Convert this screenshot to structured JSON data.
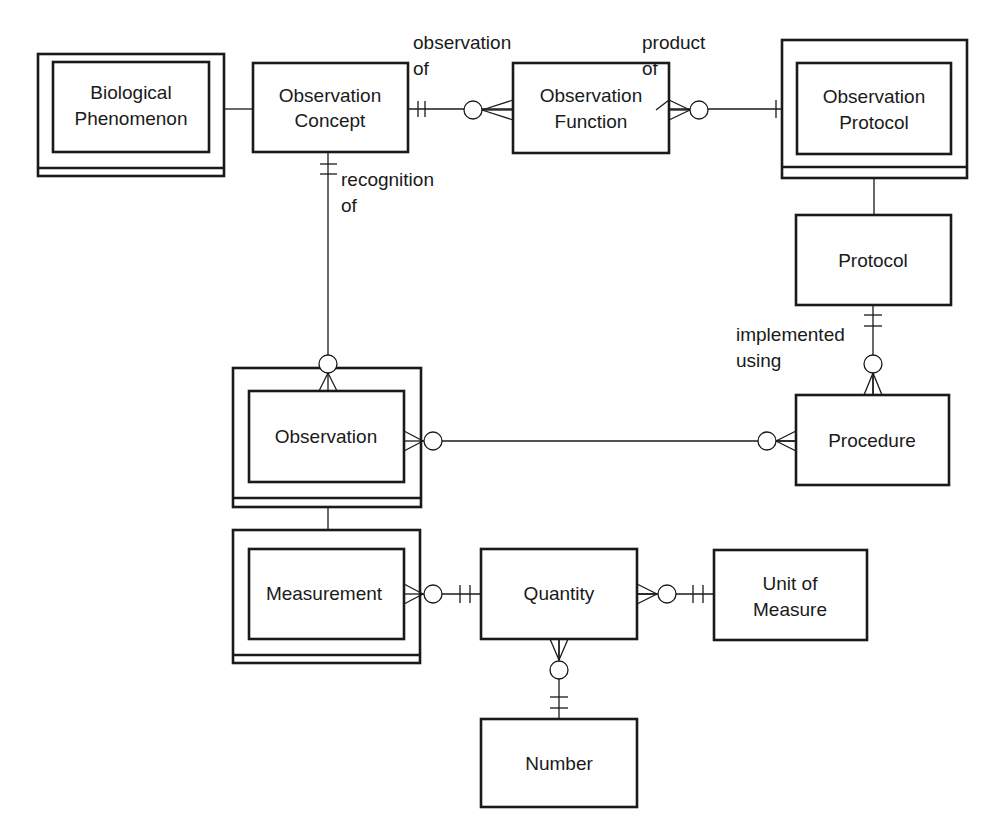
{
  "diagram": {
    "type": "entity-relationship",
    "notation": "crow's foot",
    "entities": [
      {
        "id": "biological_phenomenon",
        "lines": [
          "Biological",
          "Phenomenon"
        ],
        "weak": true
      },
      {
        "id": "observation_concept",
        "lines": [
          "Observation",
          "Concept"
        ],
        "weak": false
      },
      {
        "id": "observation_function",
        "lines": [
          "Observation",
          "Function"
        ],
        "weak": false
      },
      {
        "id": "observation_protocol",
        "lines": [
          "Observation",
          "Protocol"
        ],
        "weak": true
      },
      {
        "id": "protocol",
        "lines": [
          "Protocol"
        ],
        "weak": false
      },
      {
        "id": "observation",
        "lines": [
          "Observation"
        ],
        "weak": true
      },
      {
        "id": "procedure",
        "lines": [
          "Procedure"
        ],
        "weak": false
      },
      {
        "id": "measurement",
        "lines": [
          "Measurement"
        ],
        "weak": true
      },
      {
        "id": "quantity",
        "lines": [
          "Quantity"
        ],
        "weak": false
      },
      {
        "id": "unit_of_measure",
        "lines": [
          "Unit of",
          "Measure"
        ],
        "weak": false
      },
      {
        "id": "number",
        "lines": [
          "Number"
        ],
        "weak": false
      }
    ],
    "relationships": [
      {
        "from": "biological_phenomenon",
        "to": "observation_concept",
        "label": [],
        "from_end": "plain",
        "to_end": "plain"
      },
      {
        "from": "observation_concept",
        "to": "observation_function",
        "label": [
          "observation",
          "of"
        ],
        "from_end": "exactly-one",
        "to_end": "zero-or-many"
      },
      {
        "from": "observation_function",
        "to": "observation_protocol",
        "label": [
          "product",
          "of"
        ],
        "from_end": "zero-or-many",
        "to_end": "exactly-one"
      },
      {
        "from": "observation_protocol",
        "to": "protocol",
        "label": [],
        "from_end": "plain",
        "to_end": "plain"
      },
      {
        "from": "observation_concept",
        "to": "observation",
        "label": [
          "recognition",
          "of"
        ],
        "from_end": "exactly-one",
        "to_end": "zero-or-many"
      },
      {
        "from": "protocol",
        "to": "procedure",
        "label": [
          "implemented",
          "using"
        ],
        "from_end": "exactly-one",
        "to_end": "zero-or-many"
      },
      {
        "from": "observation",
        "to": "procedure",
        "label": [],
        "from_end": "zero-or-many",
        "to_end": "zero-or-many"
      },
      {
        "from": "observation",
        "to": "measurement",
        "label": [],
        "from_end": "plain",
        "to_end": "plain"
      },
      {
        "from": "measurement",
        "to": "quantity",
        "label": [],
        "from_end": "zero-or-many",
        "to_end": "exactly-one"
      },
      {
        "from": "quantity",
        "to": "unit_of_measure",
        "label": [],
        "from_end": "zero-or-many",
        "to_end": "exactly-one"
      },
      {
        "from": "quantity",
        "to": "number",
        "label": [],
        "from_end": "zero-or-many",
        "to_end": "exactly-one"
      }
    ]
  },
  "labels": {
    "biological_phenomenon": {
      "l1": "Biological",
      "l2": "Phenomenon"
    },
    "observation_concept": {
      "l1": "Observation",
      "l2": "Concept"
    },
    "observation_function": {
      "l1": "Observation",
      "l2": "Function"
    },
    "observation_protocol": {
      "l1": "Observation",
      "l2": "Protocol"
    },
    "protocol": "Protocol",
    "observation": "Observation",
    "procedure": "Procedure",
    "measurement": "Measurement",
    "quantity": "Quantity",
    "unit_of_measure": {
      "l1": "Unit of",
      "l2": "Measure"
    },
    "number": "Number",
    "rel_observation_of": {
      "l1": "observation",
      "l2": "of"
    },
    "rel_product_of": {
      "l1": "product",
      "l2": "of"
    },
    "rel_recognition_of": {
      "l1": "recognition",
      "l2": "of"
    },
    "rel_implemented_using": {
      "l1": "implemented",
      "l2": "using"
    }
  },
  "colors": {
    "stroke": "#1a1a1a",
    "background": "#ffffff"
  }
}
